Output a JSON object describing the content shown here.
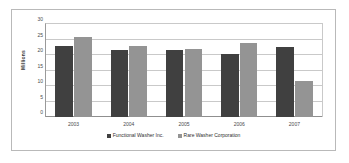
{
  "chart_data": {
    "type": "bar",
    "title": "",
    "xlabel": "",
    "ylabel": "Millions",
    "categories": [
      "2003",
      "2004",
      "2005",
      "2006",
      "2007"
    ],
    "series": [
      {
        "name": "Functional Washer Inc.",
        "color": "#404040",
        "values": [
          23.0,
          21.7,
          21.6,
          20.4,
          22.5
        ]
      },
      {
        "name": "Rare Washer Corporation",
        "color": "#949494",
        "values": [
          25.7,
          22.9,
          21.8,
          23.8,
          11.5
        ]
      }
    ],
    "ylim": [
      0,
      30
    ],
    "yticks": [
      0,
      5,
      10,
      15,
      20,
      25,
      30
    ],
    "ytick_labels": [
      "0",
      "5",
      "10",
      "15",
      "20",
      "25",
      "30"
    ],
    "grid": true,
    "legend_position": "bottom"
  },
  "colors": {
    "series_dark": "#404040",
    "series_light": "#949494",
    "gridline": "#c9c9c9",
    "axis": "#8f8f8f",
    "frame_border": "#b9b9b9",
    "background": "#ffffff"
  }
}
